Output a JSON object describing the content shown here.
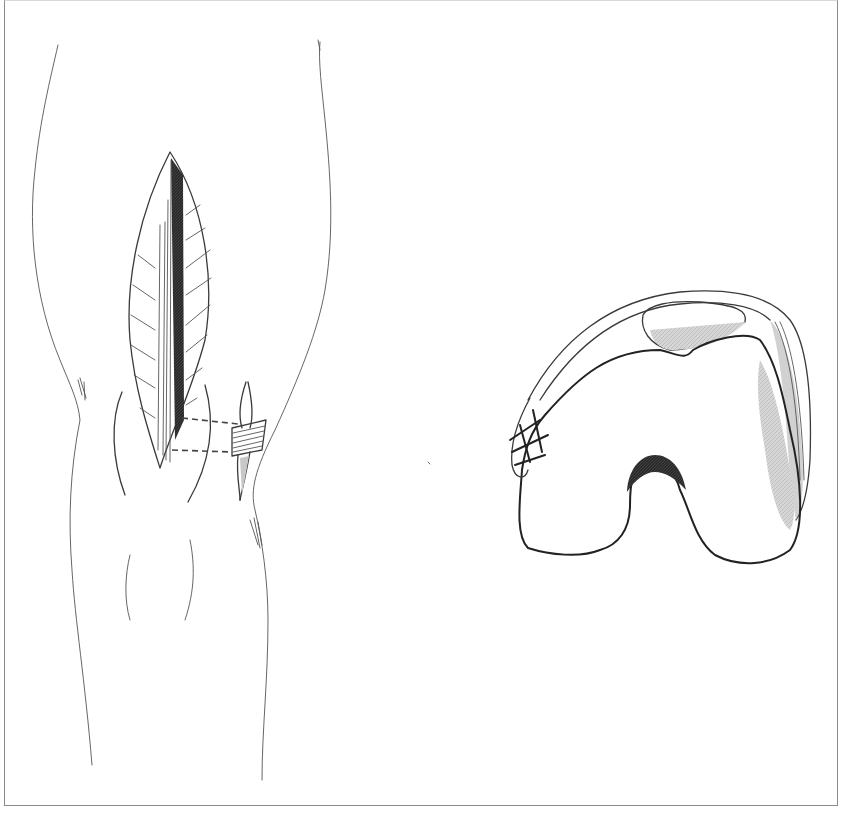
{
  "figure": {
    "type": "surgical-illustration",
    "panels": [
      {
        "id": "left",
        "depicts": "anterior view of knee with longitudinal incision and graft"
      },
      {
        "id": "right",
        "depicts": "axial cross-section of distal femur with patella and soft tissue repair"
      }
    ],
    "colors": {
      "ink": "#3a3a3a",
      "dark_fill": "#2a2a2a",
      "shade": "#cfcfcf",
      "frame": "#8a8a8a",
      "background": "#ffffff"
    }
  }
}
